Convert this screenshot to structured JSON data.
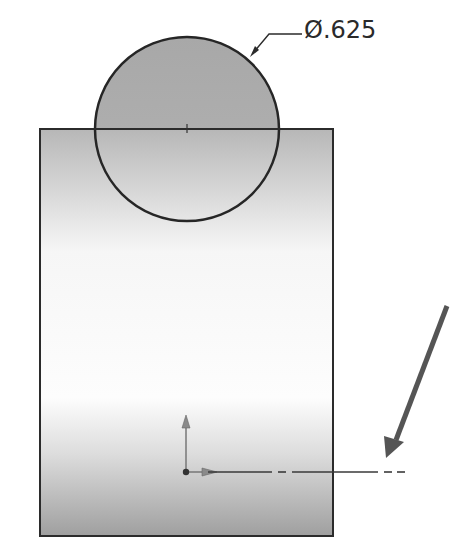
{
  "drawing": {
    "type": "sketch",
    "dimension": {
      "label": "Ø.625",
      "symbol": "diameter",
      "value": ".625"
    },
    "circle": {
      "cx": 187,
      "cy": 129,
      "r": 92
    },
    "rectangle": {
      "x": 40,
      "y": 129,
      "width": 293,
      "height": 407
    },
    "origin": {
      "x": 186,
      "y": 472
    },
    "colors": {
      "outline": "#2b2b2b",
      "fill_dark": "#a9a9a9",
      "fill_light": "#fbfbfb",
      "arrow": "#555555",
      "origin_axis": "#7a7a7a"
    },
    "icons": {
      "pointer": "arrow-pointer-icon",
      "origin": "origin-axes-icon"
    }
  }
}
